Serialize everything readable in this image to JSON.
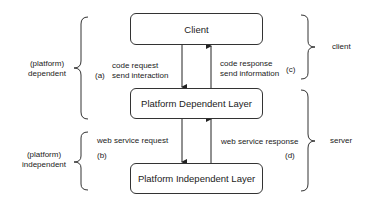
{
  "diagram": {
    "boxes": {
      "client": "Client",
      "platform_dependent": "Platform Dependent Layer",
      "platform_independent": "Platform Independent Layer"
    },
    "arrows": {
      "a": {
        "marker": "(a)",
        "line1": "code request",
        "line2": "send interaction"
      },
      "c": {
        "marker": "(c)",
        "line1": "code response",
        "line2": "send information"
      },
      "b": {
        "marker": "(b)",
        "line1": "web service request"
      },
      "d": {
        "marker": "(d)",
        "line1": "web service response"
      }
    },
    "left_braces": {
      "dependent": {
        "line1": "(platform)",
        "line2": "dependent"
      },
      "independent": {
        "line1": "(platform)",
        "line2": "independent"
      }
    },
    "right_braces": {
      "client": "client",
      "server": "server"
    }
  }
}
